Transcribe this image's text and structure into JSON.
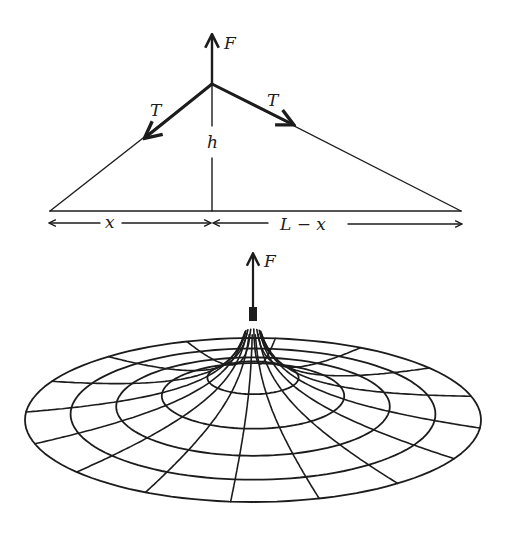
{
  "figure": {
    "string_diagram": {
      "labels": {
        "force": "F",
        "tension_left": "T",
        "tension_right": "T",
        "height": "h",
        "left_span": "x",
        "right_span": "L − x"
      },
      "geometry": {
        "apex": [
          212,
          84
        ],
        "left_end": [
          50,
          211
        ],
        "right_end": [
          461,
          211
        ],
        "force_arrow_tip": [
          212,
          33
        ]
      }
    },
    "membrane_diagram": {
      "labels": {
        "force": "F"
      },
      "geometry": {
        "center": [
          253,
          420
        ],
        "outer_rx": 228,
        "outer_ry": 82,
        "rings": 5,
        "radial_lines": 16,
        "peak_top": [
          253,
          308
        ],
        "force_arrow_tip": [
          253,
          252
        ]
      }
    },
    "ink_color": "#1c1c1c",
    "background_color": "#ffffff"
  }
}
